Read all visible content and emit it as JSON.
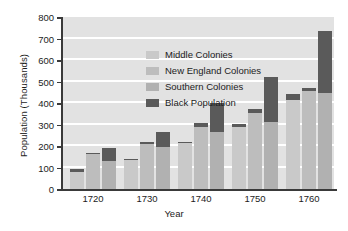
{
  "chart_data": {
    "type": "bar",
    "title": "",
    "subtitle": "",
    "xlabel": "Year",
    "ylabel": "Population (Thousands)",
    "categories": [
      "1720",
      "1730",
      "1740",
      "1750",
      "1760"
    ],
    "ylim": [
      0,
      800
    ],
    "ytick_labels": [
      "0",
      "100",
      "200",
      "300",
      "400",
      "500",
      "600",
      "700",
      "800"
    ],
    "ytick_values": [
      0,
      100,
      200,
      300,
      400,
      500,
      600,
      700,
      800
    ],
    "grid": "horizontal",
    "legend_position": "inside-top-left",
    "grouping": "grouped-bars-with-stacked-black-segment",
    "series": [
      {
        "name": "Middle Colonies",
        "color": "#c9c9c9",
        "values": [
          80,
          135,
          215,
          290,
          415
        ]
      },
      {
        "name": "New England Colonies",
        "color": "#bdbdbd",
        "values": [
          165,
          210,
          290,
          355,
          455
        ]
      },
      {
        "name": "Southern Colonies",
        "color": "#b1b1b1",
        "values": [
          130,
          195,
          265,
          310,
          445
        ]
      },
      {
        "name": "Black Population",
        "color": "#5a5a5a",
        "stacked_on": [
          "Middle Colonies",
          "New England Colonies",
          "Southern Colonies"
        ],
        "values_middle": [
          12,
          5,
          5,
          12,
          27
        ],
        "values_newengland": [
          3,
          8,
          15,
          15,
          17
        ],
        "values_southern": [
          60,
          70,
          137,
          212,
          292
        ]
      }
    ],
    "totals": {
      "1720": {
        "middle": 92,
        "new_england": 168,
        "southern": 190
      },
      "1730": {
        "middle": 140,
        "new_england": 218,
        "southern": 265
      },
      "1740": {
        "middle": 220,
        "new_england": 305,
        "southern": 402
      },
      "1750": {
        "middle": 302,
        "new_england": 370,
        "southern": 522
      },
      "1760": {
        "middle": 442,
        "new_england": 472,
        "southern": 737
      }
    }
  },
  "legend": {
    "items": [
      {
        "label": "Middle Colonies"
      },
      {
        "label": "New England Colonies"
      },
      {
        "label": "Southern Colonies"
      },
      {
        "label": "Black Population"
      }
    ]
  },
  "colors": {
    "middle": "#c9c9c9",
    "new_england": "#bdbdbd",
    "southern": "#b1b1b1",
    "black_population": "#5a5a5a",
    "plot_background": "#e2e2e2",
    "gridline": "#ffffff",
    "axis": "#3a3a3a"
  }
}
